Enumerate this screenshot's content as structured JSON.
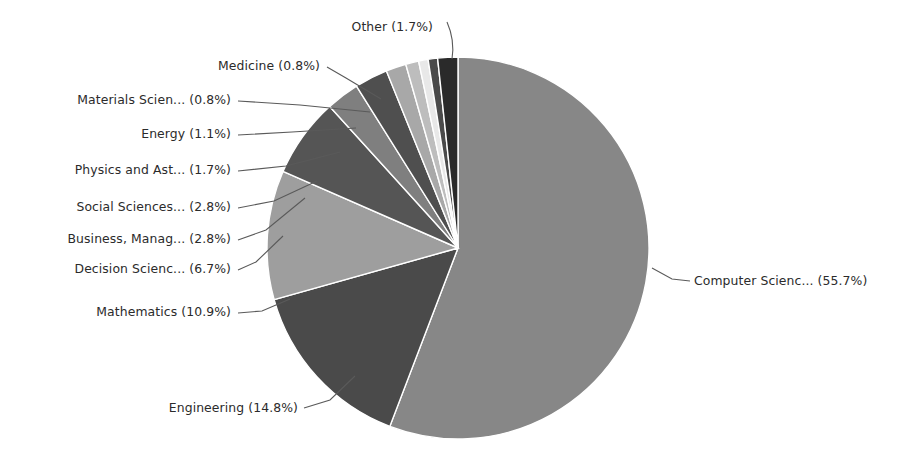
{
  "chart_data": {
    "type": "pie",
    "title": "",
    "subtitle": "",
    "xlabel": "",
    "ylabel": "",
    "legend_position": "none",
    "grid": false,
    "label_format": "{name} ({percent}%)",
    "start_angle_deg": 90,
    "direction": "clockwise",
    "categories": [
      "Computer Scienc...",
      "Engineering",
      "Mathematics",
      "Decision Scienc...",
      "Business, Manag...",
      "Social Sciences...",
      "Physics and Ast...",
      "Energy",
      "Materials Scien...",
      "Medicine",
      "Other"
    ],
    "values": [
      55.7,
      14.8,
      10.9,
      6.7,
      2.8,
      2.8,
      1.7,
      1.1,
      0.8,
      0.8,
      1.7
    ],
    "slices": [
      {
        "name": "Computer Scienc...",
        "percent": 55.7,
        "label": "Computer Scienc... (55.7%)",
        "color": "#878787",
        "label_anchor": "start",
        "label_x": 694,
        "label_y": 285,
        "leader": "M 652 268 L 672 279 L 690 281"
      },
      {
        "name": "Engineering",
        "percent": 14.8,
        "label": "Engineering (14.8%)",
        "color": "#4a4a4a",
        "label_anchor": "end",
        "label_x": 298,
        "label_y": 412,
        "leader": "M 355 376 L 330 400 L 304 408"
      },
      {
        "name": "Mathematics",
        "percent": 10.9,
        "label": "Mathematics (10.9%)",
        "color": "#9e9e9e",
        "label_anchor": "end",
        "label_x": 231,
        "label_y": 316,
        "leader": "M 290 299 L 262 311 L 238 313"
      },
      {
        "name": "Decision Scienc...",
        "percent": 6.7,
        "label": "Decision Scienc... (6.7%)",
        "color": "#555555",
        "label_anchor": "end",
        "label_x": 231,
        "label_y": 273,
        "leader": "M 283 236 L 256 262 L 238 270"
      },
      {
        "name": "Business, Manag...",
        "percent": 2.8,
        "label": "Business, Manag... (2.8%)",
        "color": "#7f7f7f",
        "label_anchor": "end",
        "label_x": 231,
        "label_y": 243,
        "leader": "M 305 198 L 266 230 L 238 240"
      },
      {
        "name": "Social Sciences...",
        "percent": 2.8,
        "label": "Social Sciences... (2.8%)",
        "color": "#4f4f4f",
        "label_anchor": "end",
        "label_x": 231,
        "label_y": 211,
        "leader": "M 317 181 L 274 201 L 238 208"
      },
      {
        "name": "Physics and Ast...",
        "percent": 1.7,
        "label": "Physics and Ast... (1.7%)",
        "color": "#a8a8a8",
        "label_anchor": "end",
        "label_x": 231,
        "label_y": 174,
        "leader": "M 340 152 L 286 166 L 238 171"
      },
      {
        "name": "Energy",
        "percent": 1.1,
        "label": "Energy (1.1%)",
        "color": "#bdbdbd",
        "label_anchor": "end",
        "label_x": 231,
        "label_y": 138,
        "leader": "M 356 128 L 292 132 L 238 135"
      },
      {
        "name": "Materials Scien...",
        "percent": 0.8,
        "label": "Materials Scien... (0.8%)",
        "color": "#e8e8e8",
        "label_anchor": "end",
        "label_x": 231,
        "label_y": 104,
        "leader": "M 370 112 L 300 105 L 238 101"
      },
      {
        "name": "Medicine",
        "percent": 0.8,
        "label": "Medicine (0.8%)",
        "color": "#4a4a4a",
        "label_anchor": "end",
        "label_x": 320,
        "label_y": 70,
        "leader": "M 381 99 L 346 78 L 327 67"
      },
      {
        "name": "Other",
        "percent": 1.7,
        "label": "Other (1.7%)",
        "color": "#2a2a2a",
        "label_anchor": "end",
        "label_x": 433,
        "label_y": 31,
        "leader": "M 452 59 Q 455 40 447 22"
      }
    ],
    "geometry": {
      "center_x": 458,
      "center_y": 248,
      "radius": 191
    },
    "colors": {
      "background": "#ffffff",
      "slice_edge": "#ffffff",
      "text": "#2b2b2b",
      "leader_line": "#5a5a5a"
    }
  }
}
